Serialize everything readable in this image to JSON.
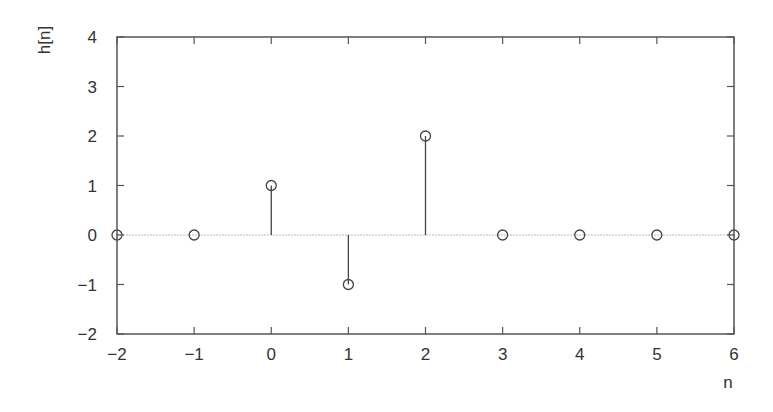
{
  "chart_data": {
    "type": "stem",
    "title": "",
    "xlabel": "n",
    "ylabel": "h[n]",
    "x": [
      -2,
      -1,
      0,
      1,
      2,
      3,
      4,
      5,
      6
    ],
    "values": [
      0,
      0,
      1,
      -1,
      2,
      0,
      0,
      0,
      0
    ],
    "xlim": [
      -2,
      6
    ],
    "ylim": [
      -2,
      4
    ],
    "xticks": [
      -2,
      -1,
      0,
      1,
      2,
      3,
      4,
      5,
      6
    ],
    "yticks": [
      -2,
      -1,
      0,
      1,
      2,
      3,
      4
    ],
    "xtick_labels": [
      "−2",
      "−1",
      "0",
      "1",
      "2",
      "3",
      "4",
      "5",
      "6"
    ],
    "ytick_labels": [
      "−2",
      "−1",
      "0",
      "1",
      "2",
      "3",
      "4"
    ],
    "grid": false,
    "baseline": 0,
    "marker": "open-circle",
    "legend": null
  },
  "style": {
    "axis_color": "#555555",
    "stem_color": "#444444",
    "marker_color": "#444444",
    "baseline_color": "#bbbbbb"
  },
  "layout": {
    "plot_left": 117,
    "plot_right": 734,
    "plot_top": 37,
    "plot_bottom": 334
  }
}
